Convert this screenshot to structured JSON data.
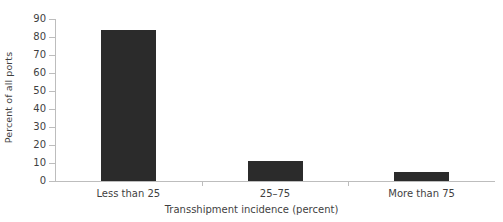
{
  "chart_data": {
    "type": "bar",
    "title": "",
    "xlabel": "Transshipment incidence (percent)",
    "ylabel": "Percent of all ports",
    "categories": [
      "Less than 25",
      "25–75",
      "More than 75"
    ],
    "values": [
      84,
      11,
      5
    ],
    "ylim": [
      0,
      90
    ],
    "yticks": [
      0,
      10,
      20,
      30,
      40,
      50,
      60,
      70,
      80,
      90
    ],
    "ytick_labels": [
      "0",
      "10",
      "20",
      "30",
      "40",
      "50",
      "60",
      "70",
      "80",
      "90"
    ],
    "grid": false,
    "legend": null,
    "series": [
      {
        "name": "Percent of all ports",
        "values": [
          84,
          11,
          5
        ]
      }
    ],
    "colors": {
      "bar": "#2b2b2b",
      "axis": "#bdbdbd",
      "text": "#3f3f3f",
      "background": "#ffffff"
    }
  }
}
